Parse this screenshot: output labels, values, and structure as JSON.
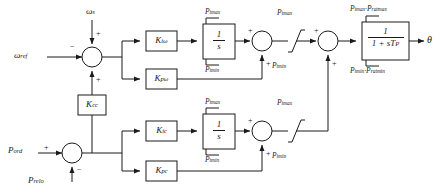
{
  "diagram": {
    "type": "control-block-diagram",
    "width": 441,
    "height": 193,
    "line_color": "#1a1a1a",
    "text_color": "#1a1a1a",
    "background": "#ffffff"
  },
  "inputs": {
    "omega_ref": {
      "base": "ω",
      "sub": "ref",
      "sign": "−"
    },
    "omega": {
      "base": "ω",
      "sub": "s",
      "sign": "+"
    },
    "p_ord": {
      "base": "P",
      "sub": "ord",
      "sign": "+"
    },
    "p_relo": {
      "base": "P",
      "sub": "relo",
      "sign": "−"
    }
  },
  "output": {
    "theta": "θ"
  },
  "gains": {
    "k_iw": {
      "base": "K",
      "sub": "iω"
    },
    "k_pw": {
      "base": "K",
      "sub": "pω"
    },
    "k_cc": {
      "base": "K",
      "sub": "cc"
    },
    "k_ic": {
      "base": "K",
      "sub": "ic"
    },
    "k_pc": {
      "base": "K",
      "sub": "pc"
    }
  },
  "integrators": {
    "upper": {
      "num": "1",
      "den": "s"
    },
    "lower": {
      "num": "1",
      "den": "s"
    }
  },
  "lag_block": {
    "num": "1",
    "den_prefix": "1 + s",
    "den_sym": "T",
    "den_sub": "P"
  },
  "limits": {
    "upper_int_max": {
      "base": "P",
      "sub": "imax"
    },
    "upper_int_min": {
      "base": "P",
      "sub": "imin"
    },
    "upper_lim_max": {
      "base": "P",
      "sub": "imax"
    },
    "upper_lim_min": {
      "base": "P",
      "sub": "imin"
    },
    "lower_int_max": {
      "base": "P",
      "sub": "imax"
    },
    "lower_int_min": {
      "base": "P",
      "sub": "imin"
    },
    "lower_lim_max": {
      "base": "P",
      "sub": "imax"
    },
    "lower_lim_min": {
      "base": "P",
      "sub": "imin"
    },
    "lag_max": {
      "a_base": "P",
      "a_sub": "imax",
      "sep": "·",
      "b_base": "P",
      "b_sub": "ratmax"
    },
    "lag_min": {
      "a_base": "P",
      "a_sub": "imin",
      "sep": "·",
      "b_base": "P",
      "b_sub": "ratmin"
    }
  },
  "sum_signs": {
    "s1_top": "+",
    "s1_left": "−",
    "s1_bottom": "+",
    "s2_top": "+",
    "s2_bottom": "+",
    "s3_top": "+",
    "s3_bottom": "+",
    "s4_top": "+",
    "s4_bottom": "+",
    "s5_left": "+",
    "s5_bottom": "−"
  }
}
